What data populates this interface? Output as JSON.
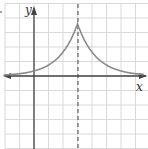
{
  "chart_data": {
    "type": "line",
    "title": "",
    "xlabel": "x",
    "ylabel": "y",
    "grid": true,
    "grid_units": {
      "x": [
        -2,
        7
      ],
      "y": [
        -5,
        5
      ]
    },
    "asymptote_or_guide": {
      "type": "dashed-vertical",
      "x": 3
    },
    "curve": {
      "description": "Symmetric cusp at x=3, decaying toward the x-axis (horizontal asymptote y=0) on both sides",
      "points": [
        {
          "x": -2,
          "y": 0.15
        },
        {
          "x": -1,
          "y": 0.25
        },
        {
          "x": 0,
          "y": 0.4
        },
        {
          "x": 1,
          "y": 0.8
        },
        {
          "x": 2,
          "y": 1.7
        },
        {
          "x": 2.5,
          "y": 2.5
        },
        {
          "x": 3,
          "y": 3.6
        },
        {
          "x": 3.5,
          "y": 2.5
        },
        {
          "x": 4,
          "y": 1.7
        },
        {
          "x": 5,
          "y": 0.8
        },
        {
          "x": 6,
          "y": 0.4
        },
        {
          "x": 7,
          "y": 0.2
        }
      ]
    },
    "colors": {
      "curve": "#8a8a8a",
      "axes": "#333333",
      "grid": "#d9d9d9",
      "dashed": "#333333"
    }
  },
  "labels": {
    "x_axis": "x",
    "y_axis": "y"
  }
}
